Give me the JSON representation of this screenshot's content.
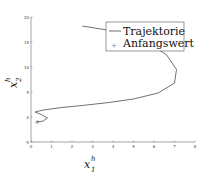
{
  "chart_data": {
    "type": "line",
    "title": "",
    "xlabel": "x_1^h",
    "ylabel": "x_2^h",
    "xlim": [
      0,
      8
    ],
    "ylim": [
      -5,
      20
    ],
    "xticks": [
      "0",
      "1",
      "2",
      "3",
      "4",
      "5",
      "6",
      "7",
      "8"
    ],
    "yticks": [
      "-5",
      "0",
      "5",
      "10",
      "15",
      "20"
    ],
    "grid": false,
    "legend_position": "upper right",
    "series": [
      {
        "name": "Trajektorie",
        "style": "solid line",
        "x": [
          2.5,
          4.0,
          5.5,
          6.6,
          7.1,
          7.0,
          6.2,
          5.0,
          3.8,
          2.5,
          1.5,
          0.6,
          0.2,
          0.5,
          0.8,
          0.6,
          0.3
        ],
        "y": [
          18.2,
          17.2,
          15.2,
          12.5,
          9.5,
          6.8,
          4.8,
          3.6,
          2.9,
          2.3,
          1.9,
          1.4,
          1.0,
          0.5,
          -0.2,
          -0.8,
          -1.0
        ]
      },
      {
        "name": "Anfangswert",
        "style": "plus marker",
        "x": [
          0.3
        ],
        "y": [
          -1.0
        ]
      }
    ]
  },
  "legend": {
    "items": [
      "Trajektorie",
      "Anfangswert"
    ]
  },
  "axes": {
    "xlabel_main": "x",
    "xlabel_sup": "h",
    "xlabel_sub": "1",
    "ylabel_main": "x",
    "ylabel_sup": "h",
    "ylabel_sub": "2"
  }
}
